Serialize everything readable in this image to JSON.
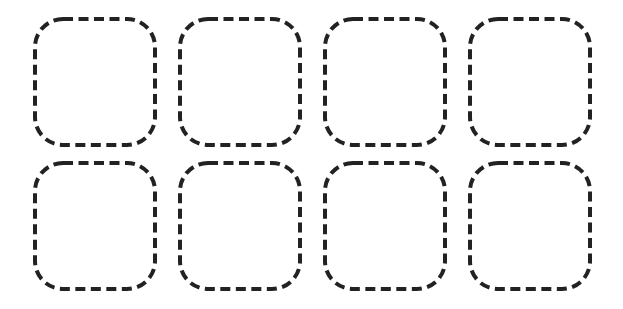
{
  "grid": {
    "rows": 2,
    "columns": 4,
    "stroke_color": "#222222",
    "slots": [
      {
        "row": 1,
        "col": 1,
        "x": 33,
        "y": 17
      },
      {
        "row": 1,
        "col": 2,
        "x": 178,
        "y": 17
      },
      {
        "row": 1,
        "col": 3,
        "x": 323,
        "y": 17
      },
      {
        "row": 1,
        "col": 4,
        "x": 468,
        "y": 17
      },
      {
        "row": 2,
        "col": 1,
        "x": 33,
        "y": 161
      },
      {
        "row": 2,
        "col": 2,
        "x": 178,
        "y": 161
      },
      {
        "row": 2,
        "col": 3,
        "x": 323,
        "y": 161
      },
      {
        "row": 2,
        "col": 4,
        "x": 468,
        "y": 161
      }
    ]
  }
}
